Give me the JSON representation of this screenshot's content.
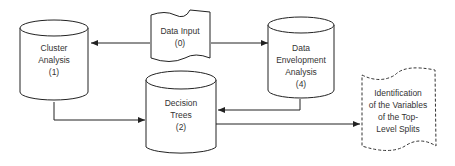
{
  "diagram": {
    "nodes": {
      "data_input": {
        "lines": [
          "Data Input",
          "(0)"
        ],
        "shape": "document"
      },
      "cluster_analysis": {
        "lines": [
          "Cluster",
          "Analysis",
          "(1)"
        ],
        "shape": "cylinder"
      },
      "decision_trees": {
        "lines": [
          "Decision",
          "Trees",
          "(2)"
        ],
        "shape": "cylinder"
      },
      "dea": {
        "lines": [
          "Data",
          "Envelopment",
          "Analysis",
          "(4)"
        ],
        "shape": "cylinder"
      },
      "identification": {
        "lines": [
          "Identification",
          "of the Variables",
          "of the Top-",
          "Level Splits"
        ],
        "shape": "dashed-document"
      }
    },
    "edges": [
      {
        "from": "data_input",
        "to": "cluster_analysis"
      },
      {
        "from": "data_input",
        "to": "dea"
      },
      {
        "from": "cluster_analysis",
        "to": "decision_trees"
      },
      {
        "from": "dea",
        "to": "decision_trees"
      },
      {
        "from": "decision_trees",
        "to": "identification"
      }
    ],
    "colors": {
      "stroke": "#222222",
      "text": "#333333",
      "background": "#ffffff"
    }
  }
}
